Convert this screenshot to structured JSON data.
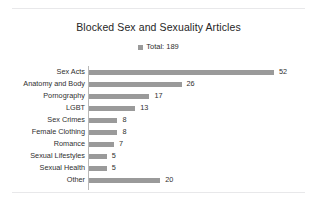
{
  "chart_data": {
    "type": "bar",
    "orientation": "horizontal",
    "title": "Blocked Sex and Sexuality Articles",
    "xlabel": "",
    "ylabel": "",
    "grid": false,
    "legend_position": "top-center",
    "legend": [
      "Total: 189"
    ],
    "xlim": [
      0,
      52
    ],
    "categories": [
      "Sex Acts",
      "Anatomy and Body",
      "Pornography",
      "LGBT",
      "Sex Crimes",
      "Female Clothing",
      "Romance",
      "Sexual Lifestyles",
      "Sexual Health",
      "Other"
    ],
    "values": [
      52,
      26,
      17,
      13,
      8,
      8,
      7,
      5,
      5,
      20
    ],
    "data_labels": [
      "52",
      "26",
      "17",
      "13",
      "8",
      "8",
      "7",
      "5",
      "5",
      "20"
    ],
    "series": [
      {
        "name": "Total: 189",
        "values": [
          52,
          26,
          17,
          13,
          8,
          8,
          7,
          5,
          5,
          20
        ]
      }
    ],
    "colors": {
      "bar": "#9a9a9a",
      "title_text": "#262626",
      "label_text": "#2f2f2f",
      "axis_line": "#b8b8b8",
      "background": "#ffffff",
      "rule": "#e8e8ea"
    }
  }
}
